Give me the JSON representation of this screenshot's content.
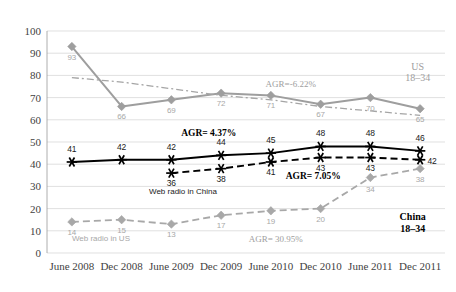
{
  "chart_data": {
    "type": "line",
    "title": "",
    "subtitle": "",
    "xlabel": "",
    "ylabel": "",
    "ylim": [
      0,
      100
    ],
    "ytick_step": 10,
    "grid": true,
    "legend_position": "inline-annotations",
    "categories": [
      "June 2008",
      "Dec 2008",
      "June 2009",
      "Dec 2009",
      "June 2010",
      "Dec 2010",
      "June 2011",
      "Dec 2011"
    ],
    "yticks": [
      "0",
      "10",
      "20",
      "30",
      "40",
      "50",
      "60",
      "70",
      "80",
      "90",
      "100"
    ],
    "series": [
      {
        "name": "US 18-34",
        "style": "solid-gray-diamond",
        "color": "#9e9e9e",
        "values": [
          93,
          66,
          69,
          72,
          71,
          67,
          70,
          65
        ],
        "labels": [
          "93",
          "66",
          "69",
          "72",
          "71",
          "67",
          "70",
          "65"
        ]
      },
      {
        "name": "US 18-34 trendline",
        "style": "dash-dot-gray",
        "color": "#9e9e9e",
        "values": [
          79,
          77,
          74,
          71,
          69,
          66,
          64,
          62
        ],
        "labels": []
      },
      {
        "name": "Overall web radio",
        "style": "solid-black-asterisk",
        "color": "#000000",
        "values": [
          41,
          42,
          42,
          44,
          45,
          48,
          48,
          46
        ],
        "labels": [
          "41",
          "42",
          "42",
          "44",
          "45",
          "48",
          "48",
          "46"
        ]
      },
      {
        "name": "Web radio in China",
        "style": "dashed-black-asterisk",
        "color": "#000000",
        "values": [
          null,
          null,
          36,
          38,
          41,
          43,
          43,
          42
        ],
        "labels": [
          "",
          "",
          "36",
          "38",
          "41",
          "43",
          "43",
          "42"
        ]
      },
      {
        "name": "Web radio in US",
        "style": "dashed-gray-diamond",
        "color": "#a8a8a8",
        "values": [
          14,
          15,
          13,
          17,
          19,
          20,
          34,
          38
        ],
        "labels": [
          "14",
          "15",
          "13",
          "17",
          "19",
          "20",
          "34",
          "38"
        ]
      }
    ],
    "annotations": [
      {
        "id": "agr-us",
        "text": "AGR=-6.22%",
        "style": "gray",
        "x_cat": 4.4,
        "y": 75
      },
      {
        "id": "agr-overall",
        "text": "AGR= 4.37%",
        "style": "dark-bold",
        "x_cat": 2.75,
        "y": 52.5
      },
      {
        "id": "agr-china-webradio",
        "text": "AGR= 7.05%",
        "style": "dark-bold",
        "x_cat": 4.85,
        "y": 33.5
      },
      {
        "id": "agr-china",
        "text": "AGR= 30.95%",
        "style": "gray",
        "x_cat": 4.1,
        "y": 5.0
      }
    ],
    "series_inline_labels": [
      {
        "id": "label-web-radio-china",
        "text": "Web radio in China",
        "style": "dark",
        "x_cat": 1.55,
        "y": 26.5
      },
      {
        "id": "label-web-radio-us",
        "text": "Web radio in US",
        "style": "gray",
        "x_cat": 0.0,
        "y": 5.5
      }
    ],
    "corner_labels": [
      {
        "id": "corner-us",
        "line1": "US",
        "line2": "18–34",
        "style": "gray",
        "x_cat": 6.95,
        "y_line1": 82.5,
        "y_line2": 77.5
      },
      {
        "id": "corner-china",
        "line1": "China",
        "line2": "18–34",
        "style": "dark-bold",
        "x_cat": 6.85,
        "y_line1": 15.0,
        "y_line2": 9.5
      }
    ]
  }
}
